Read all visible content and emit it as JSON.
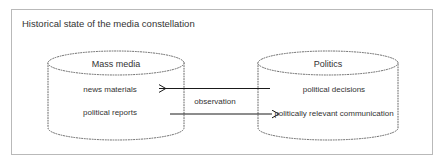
{
  "frame": {
    "title": "Historical state of the media constellation",
    "border_color": "#b9b9b9",
    "background": "#ffffff"
  },
  "theme": {
    "text_color": "#333333",
    "shape_stroke": "#555555",
    "arrow_color": "#1a1a1a"
  },
  "nodes": [
    {
      "id": "mass-media",
      "title": "Mass media",
      "items": [
        "news materials",
        "political reports"
      ]
    },
    {
      "id": "politics",
      "title": "Politics",
      "items": [
        "political decisions",
        "politically relevant communication"
      ]
    }
  ],
  "edges": [
    {
      "id": "observation",
      "label": "observation",
      "from": "politics",
      "to": "mass-media",
      "direction": "left"
    },
    {
      "id": "reports-flow",
      "label": "",
      "from": "mass-media",
      "to": "politics",
      "direction": "right"
    }
  ]
}
